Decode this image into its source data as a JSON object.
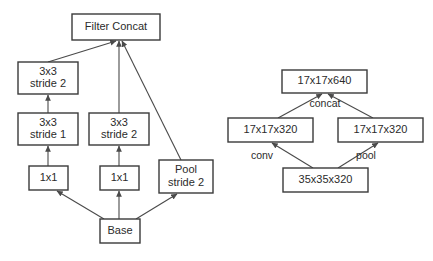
{
  "figure": {
    "background_color": "#ffffff",
    "line_color": "#4a4a4a",
    "box_stroke_color": "#3a3a3a",
    "text_color": "#2b2b2b"
  },
  "diagrams": [
    {
      "id": "left-diagram",
      "name": "grid-size-reduction-module",
      "nodes": [
        {
          "id": "filter-concat",
          "lines": [
            "Filter Concat"
          ],
          "x": 72,
          "y": 14,
          "w": 88,
          "h": 26
        },
        {
          "id": "conv-3x3-stride-2-left",
          "lines": [
            "3x3",
            "stride 2"
          ],
          "x": 18,
          "y": 62,
          "w": 60,
          "h": 32
        },
        {
          "id": "conv-3x3-stride-1",
          "lines": [
            "3x3",
            "stride 1"
          ],
          "x": 18,
          "y": 113,
          "w": 60,
          "h": 32
        },
        {
          "id": "conv-1x1-left",
          "lines": [
            "1x1"
          ],
          "x": 29,
          "y": 166,
          "w": 39,
          "h": 24
        },
        {
          "id": "conv-3x3-stride-2-middle",
          "lines": [
            "3x3",
            "stride 2"
          ],
          "x": 89,
          "y": 113,
          "w": 60,
          "h": 32
        },
        {
          "id": "conv-1x1-middle",
          "lines": [
            "1x1"
          ],
          "x": 100,
          "y": 166,
          "w": 39,
          "h": 24
        },
        {
          "id": "pool-stride-2",
          "lines": [
            "Pool",
            "stride 2"
          ],
          "x": 159,
          "y": 160,
          "w": 54,
          "h": 33
        },
        {
          "id": "base",
          "lines": [
            "Base"
          ],
          "x": 100,
          "y": 219,
          "w": 40,
          "h": 24
        }
      ],
      "edges": [
        {
          "id": "edge-3x3s2left-to-concat",
          "from": [
            48,
            62
          ],
          "to": [
            116,
            41
          ]
        },
        {
          "id": "edge-3x3s2mid-to-concat",
          "from": [
            119,
            113
          ],
          "to": [
            119,
            41
          ]
        },
        {
          "id": "edge-pool-to-concat",
          "from": [
            181,
            160
          ],
          "to": [
            122,
            41
          ]
        },
        {
          "id": "edge-3x3s1-to-3x3s2left",
          "from": [
            48,
            113
          ],
          "to": [
            48,
            95
          ]
        },
        {
          "id": "edge-1x1left-to-3x3s1",
          "from": [
            48,
            166
          ],
          "to": [
            48,
            146
          ]
        },
        {
          "id": "edge-1x1mid-to-3x3s2mid",
          "from": [
            119,
            166
          ],
          "to": [
            119,
            146
          ]
        },
        {
          "id": "edge-base-to-1x1left",
          "from": [
            104,
            219
          ],
          "to": [
            57,
            191
          ]
        },
        {
          "id": "edge-base-to-1x1mid",
          "from": [
            119,
            219
          ],
          "to": [
            119,
            191
          ]
        },
        {
          "id": "edge-base-to-pool",
          "from": [
            136,
            219
          ],
          "to": [
            177,
            194
          ]
        }
      ],
      "edge_labels": []
    },
    {
      "id": "right-diagram",
      "name": "tensor-shape-reduction-module",
      "nodes": [
        {
          "id": "out-17x17x640",
          "lines": [
            "17x17x640"
          ],
          "x": 282,
          "y": 70,
          "w": 85,
          "h": 23
        },
        {
          "id": "branch-left-17x17x320",
          "lines": [
            "17x17x320"
          ],
          "x": 228,
          "y": 118,
          "w": 85,
          "h": 24
        },
        {
          "id": "branch-right-17x17x320",
          "lines": [
            "17x17x320"
          ],
          "x": 338,
          "y": 118,
          "w": 85,
          "h": 24
        },
        {
          "id": "in-35x35x320",
          "lines": [
            "35x35x320"
          ],
          "x": 283,
          "y": 168,
          "w": 85,
          "h": 24
        }
      ],
      "edges": [
        {
          "id": "edge-left320-to-640",
          "from": [
            278,
            118
          ],
          "to": [
            322,
            94
          ]
        },
        {
          "id": "edge-right320-to-640",
          "from": [
            373,
            118
          ],
          "to": [
            328,
            94
          ]
        },
        {
          "id": "edge-in-to-left320",
          "from": [
            313,
            168
          ],
          "to": [
            272,
            143
          ]
        },
        {
          "id": "edge-in-to-right320",
          "from": [
            338,
            168
          ],
          "to": [
            378,
            143
          ]
        }
      ],
      "edge_labels": [
        {
          "id": "label-concat",
          "text": "concat",
          "x": 325,
          "y": 104
        },
        {
          "id": "label-conv",
          "text": "conv",
          "x": 262,
          "y": 156
        },
        {
          "id": "label-pool",
          "text": "pool",
          "x": 366,
          "y": 156
        }
      ]
    }
  ]
}
